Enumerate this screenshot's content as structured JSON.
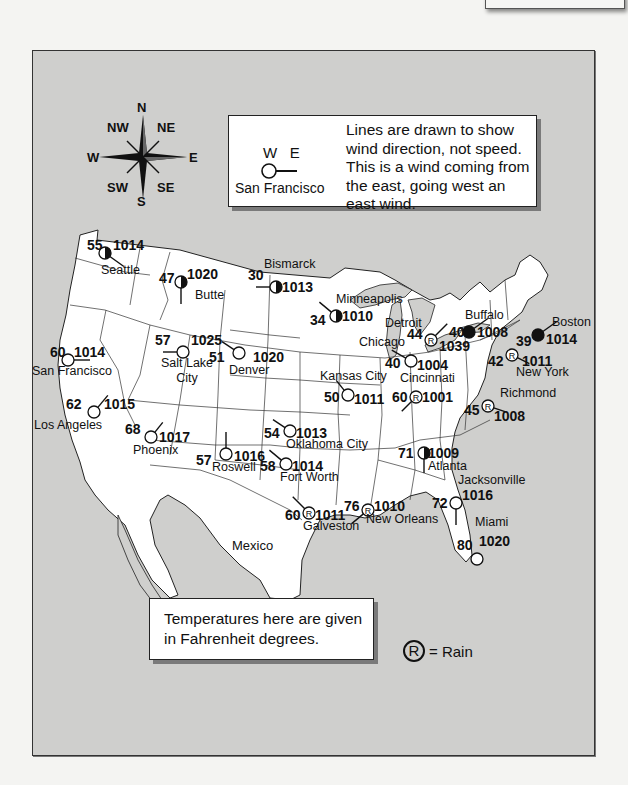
{
  "wind_legend": {
    "directions": "W   E",
    "example_city": "San Francisco",
    "description": "Lines are drawn to show wind direction, not speed. This is a wind coming from the east, going west an east wind."
  },
  "temperature_note": "Temperatures here are given in Fahrenheit degrees.",
  "rain_legend": {
    "symbol": "R",
    "label": "= Rain"
  },
  "compass": {
    "n": "N",
    "ne": "NE",
    "e": "E",
    "se": "SE",
    "s": "S",
    "sw": "SW",
    "w": "W",
    "nw": "NW"
  },
  "region_label": "Mexico",
  "colors": {
    "background": "#f4f4f2",
    "water_frame": "#cfcfcd",
    "land": "#ffffff",
    "ink": "#111111"
  },
  "stations": [
    {
      "city": "Seattle",
      "temp": "55",
      "pressure": "1014",
      "sky": "half",
      "rain": false
    },
    {
      "city": "Butte",
      "temp": "47",
      "pressure": "1020",
      "sky": "half",
      "rain": false
    },
    {
      "city": "Bismarck",
      "temp": "30",
      "pressure": "1013",
      "sky": "half",
      "rain": false
    },
    {
      "city": "Minneapolis",
      "temp": "34",
      "pressure": "1010",
      "sky": "half",
      "rain": false
    },
    {
      "city": "Detroit",
      "temp": "44",
      "pressure": "1039",
      "sky": "rain",
      "rain": true
    },
    {
      "city": "Buffalo",
      "temp": "40",
      "pressure": "1008",
      "sky": "full",
      "rain": false
    },
    {
      "city": "Boston",
      "temp": "39",
      "pressure": "1014",
      "sky": "full",
      "rain": false
    },
    {
      "city": "Chicago",
      "temp": "40",
      "pressure": "1004",
      "sky": "clear",
      "rain": false
    },
    {
      "city": "New York",
      "temp": "42",
      "pressure": "1011",
      "sky": "rain",
      "rain": true
    },
    {
      "city": "San Francisco",
      "temp": "60",
      "pressure": "1014",
      "sky": "clear",
      "rain": false
    },
    {
      "city": "Salt Lake City",
      "temp": "57",
      "pressure": "1025",
      "sky": "clear",
      "rain": false
    },
    {
      "city": "Denver",
      "temp": "51",
      "pressure": "1020",
      "sky": "clear",
      "rain": false
    },
    {
      "city": "Kansas City",
      "temp": "50",
      "pressure": "1011",
      "sky": "clear",
      "rain": false
    },
    {
      "city": "Cincinnati",
      "temp": "60",
      "pressure": "1001",
      "sky": "rain",
      "rain": true
    },
    {
      "city": "Richmond",
      "temp": "45",
      "pressure": "1008",
      "sky": "rain",
      "rain": true
    },
    {
      "city": "Los Angeles",
      "temp": "62",
      "pressure": "1015",
      "sky": "clear",
      "rain": false
    },
    {
      "city": "Phoenix",
      "temp": "68",
      "pressure": "1017",
      "sky": "clear",
      "rain": false
    },
    {
      "city": "Oklahoma City",
      "temp": "54",
      "pressure": "1013",
      "sky": "clear",
      "rain": false
    },
    {
      "city": "Roswell",
      "temp": "57",
      "pressure": "1016",
      "sky": "clear",
      "rain": false
    },
    {
      "city": "Fort Worth",
      "temp": "58",
      "pressure": "1014",
      "sky": "clear",
      "rain": false
    },
    {
      "city": "Atlanta",
      "temp": "71",
      "pressure": "1009",
      "sky": "half",
      "rain": false
    },
    {
      "city": "Jacksonville",
      "temp": "72",
      "pressure": "1016",
      "sky": "clear",
      "rain": false
    },
    {
      "city": "Galveston",
      "temp": "60",
      "pressure": "1011",
      "sky": "rain",
      "rain": true
    },
    {
      "city": "New Orleans",
      "temp": "76",
      "pressure": "1010",
      "sky": "rain",
      "rain": true
    },
    {
      "city": "Miami",
      "temp": "80",
      "pressure": "1020",
      "sky": "clear",
      "rain": false
    }
  ]
}
